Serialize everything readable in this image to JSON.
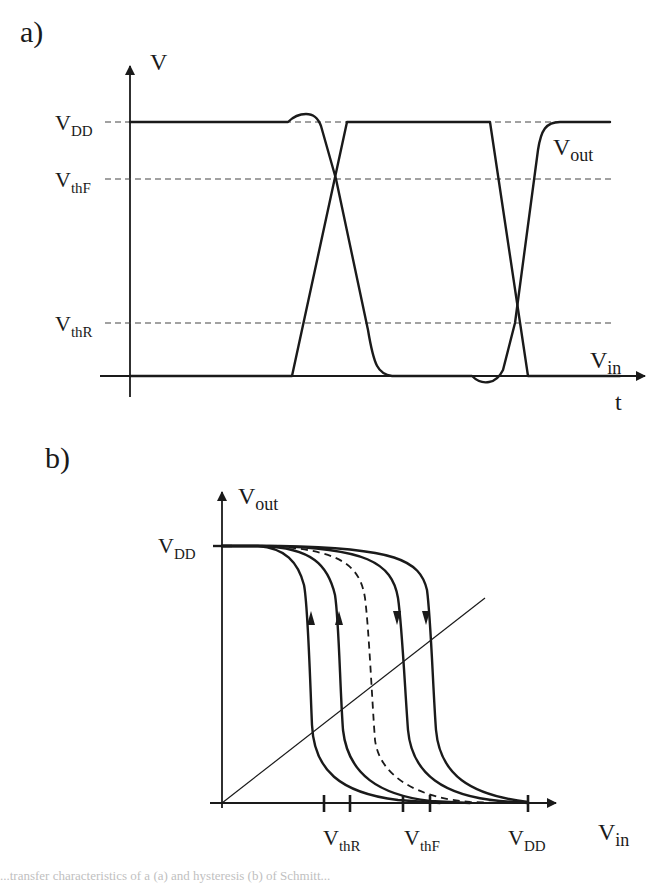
{
  "panel_a": {
    "label": "a)",
    "y_axis": {
      "label": "V"
    },
    "x_axis": {
      "label": "t"
    },
    "levels": [
      {
        "main": "V",
        "sub": "DD"
      },
      {
        "main": "V",
        "sub": "thF"
      },
      {
        "main": "V",
        "sub": "thR"
      }
    ],
    "signals": {
      "vout": {
        "main": "V",
        "sub": "out"
      },
      "vin": {
        "main": "V",
        "sub": "in"
      }
    }
  },
  "panel_b": {
    "label": "b)",
    "y_axis": {
      "main": "V",
      "sub": "out"
    },
    "y_level": {
      "main": "V",
      "sub": "DD"
    },
    "x_axis": {
      "main": "V",
      "sub": "in"
    },
    "x_ticks": [
      {
        "main": "V",
        "sub": "thR"
      },
      {
        "main": "V",
        "sub": "thF"
      },
      {
        "main": "V",
        "sub": "DD"
      }
    ],
    "curve_count": 5,
    "dashed_curve_index": 2
  },
  "caption": {
    "text": "...transfer characteristics of a (a) and hysteresis (b) of Schmitt..."
  }
}
